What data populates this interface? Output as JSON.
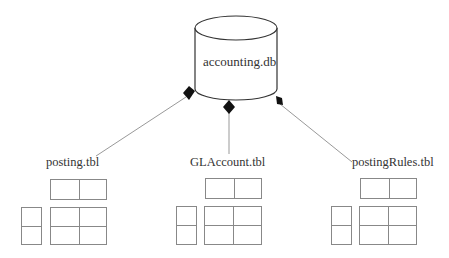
{
  "diagram": {
    "database": {
      "label": "accounting.db",
      "icon": "database-cylinder-icon"
    },
    "connector_style": "filled-diamond",
    "tables": [
      {
        "label": "posting.tbl"
      },
      {
        "label": "GLAccount.tbl"
      },
      {
        "label": "postingRules.tbl"
      }
    ]
  }
}
